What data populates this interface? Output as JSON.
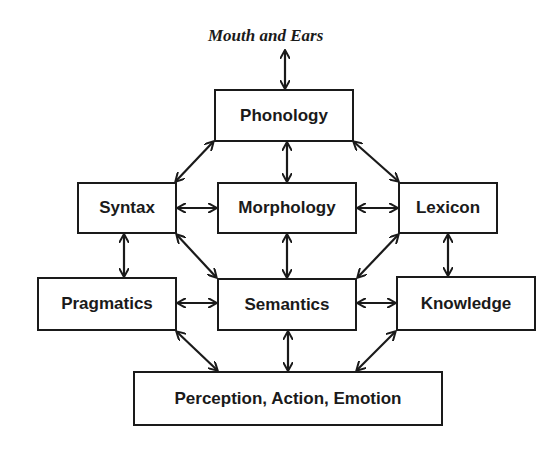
{
  "top_label": "Mouth and Ears",
  "nodes": {
    "phonology": "Phonology",
    "syntax": "Syntax",
    "morphology": "Morphology",
    "lexicon": "Lexicon",
    "pragmatics": "Pragmatics",
    "semantics": "Semantics",
    "knowledge": "Knowledge",
    "perception": "Perception, Action, Emotion"
  },
  "edges": [
    [
      "Mouth and Ears",
      "Phonology"
    ],
    [
      "Phonology",
      "Syntax"
    ],
    [
      "Phonology",
      "Morphology"
    ],
    [
      "Phonology",
      "Lexicon"
    ],
    [
      "Syntax",
      "Morphology"
    ],
    [
      "Morphology",
      "Lexicon"
    ],
    [
      "Syntax",
      "Pragmatics"
    ],
    [
      "Syntax",
      "Semantics"
    ],
    [
      "Morphology",
      "Semantics"
    ],
    [
      "Lexicon",
      "Semantics"
    ],
    [
      "Lexicon",
      "Knowledge"
    ],
    [
      "Pragmatics",
      "Semantics"
    ],
    [
      "Semantics",
      "Knowledge"
    ],
    [
      "Pragmatics",
      "Perception, Action, Emotion"
    ],
    [
      "Semantics",
      "Perception, Action, Emotion"
    ],
    [
      "Knowledge",
      "Perception, Action, Emotion"
    ]
  ],
  "colors": {
    "line": "#1a1a1a",
    "background": "#ffffff"
  }
}
